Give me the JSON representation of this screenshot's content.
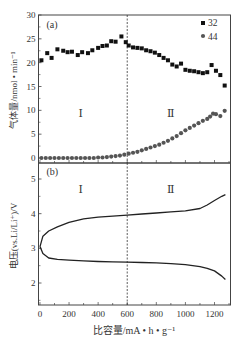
{
  "chart_data": [
    {
      "panel": "(a)",
      "type": "scatter",
      "title": "",
      "xlabel": "比容量/mA • h • g⁻¹",
      "ylabel": "气体量/nmol • min⁻¹",
      "xlim": [
        -10,
        1310
      ],
      "ylim": [
        0,
        30
      ],
      "yticks": [
        0,
        5,
        10,
        15,
        20,
        25,
        30
      ],
      "xticks": [
        0,
        200,
        400,
        600,
        800,
        1000,
        1200
      ],
      "grid": false,
      "legend_position": "top-right",
      "annotations": [
        "(a)",
        "Ⅰ",
        "Ⅱ"
      ],
      "vertical_line_x": 600,
      "series": [
        {
          "name": "32",
          "marker": "square",
          "x": [
            10,
            50,
            80,
            120,
            160,
            190,
            220,
            260,
            290,
            330,
            360,
            400,
            430,
            460,
            490,
            520,
            560,
            590,
            610,
            640,
            670,
            700,
            730,
            760,
            790,
            820,
            850,
            880,
            910,
            940,
            970,
            1000,
            1030,
            1060,
            1090,
            1120,
            1150,
            1180,
            1210,
            1240,
            1270
          ],
          "y": [
            20.5,
            22,
            21,
            22.8,
            22.5,
            22.2,
            22.3,
            21.6,
            22.2,
            22,
            22.6,
            23.1,
            23.5,
            23.6,
            24.5,
            24.4,
            25.5,
            24.3,
            23.6,
            23.2,
            23.1,
            23,
            22.6,
            22.4,
            22.1,
            21.6,
            21,
            20.5,
            19.6,
            19.2,
            19.8,
            18.5,
            18.3,
            18.2,
            18,
            17.8,
            18,
            19.5,
            18.3,
            17.4,
            15.2
          ]
        },
        {
          "name": "44",
          "marker": "circle",
          "x": [
            10,
            40,
            70,
            100,
            130,
            160,
            190,
            220,
            250,
            280,
            310,
            340,
            370,
            400,
            430,
            460,
            490,
            520,
            550,
            580,
            610,
            640,
            670,
            700,
            730,
            760,
            790,
            820,
            850,
            880,
            910,
            940,
            970,
            1000,
            1030,
            1060,
            1090,
            1120,
            1150,
            1170,
            1190,
            1210,
            1240,
            1270
          ],
          "y": [
            0,
            0,
            0,
            0,
            0,
            0,
            0,
            0,
            0,
            0,
            0,
            0,
            0,
            0.1,
            0.1,
            0.2,
            0.3,
            0.4,
            0.5,
            0.7,
            0.9,
            1.1,
            1.3,
            1.6,
            1.9,
            2.2,
            2.5,
            2.8,
            3.2,
            3.6,
            4.1,
            4.6,
            5.2,
            5.8,
            6.3,
            6.8,
            7.3,
            7.8,
            8.2,
            8.7,
            9.3,
            9.2,
            8.8,
            9.9
          ]
        }
      ]
    },
    {
      "panel": "(b)",
      "type": "line",
      "title": "",
      "xlabel": "比容量/mA • h • g⁻¹",
      "ylabel": "电压(vs.Li/Li⁺)/V",
      "xlim": [
        -10,
        1310
      ],
      "ylim": [
        1.3,
        5.1
      ],
      "yticks": [
        2,
        3,
        4,
        5
      ],
      "xticks": [
        0,
        200,
        400,
        600,
        800,
        1000,
        1200
      ],
      "grid": false,
      "annotations": [
        "(b)",
        "Ⅰ",
        "Ⅱ"
      ],
      "vertical_line_x": 600,
      "series": [
        {
          "name": "charge",
          "x": [
            0,
            20,
            60,
            120,
            200,
            300,
            400,
            500,
            600,
            700,
            800,
            900,
            1000,
            1100,
            1150,
            1200,
            1250,
            1275
          ],
          "y": [
            3.05,
            3.35,
            3.5,
            3.62,
            3.75,
            3.85,
            3.9,
            3.93,
            3.96,
            3.99,
            4.02,
            4.05,
            4.08,
            4.15,
            4.25,
            4.38,
            4.5,
            4.55
          ]
        },
        {
          "name": "discharge",
          "x": [
            0,
            20,
            60,
            120,
            200,
            300,
            400,
            500,
            600,
            700,
            800,
            900,
            1000,
            1100,
            1150,
            1200,
            1250,
            1275
          ],
          "y": [
            3.05,
            2.85,
            2.72,
            2.68,
            2.66,
            2.64,
            2.62,
            2.61,
            2.6,
            2.59,
            2.58,
            2.56,
            2.53,
            2.47,
            2.42,
            2.35,
            2.2,
            2.1
          ]
        }
      ]
    }
  ],
  "labels": {
    "panel_a": "(a)",
    "panel_b": "(b)",
    "region_1": "Ⅰ",
    "region_2": "Ⅱ",
    "legend_32": "32",
    "legend_44": "44",
    "ylabel_a": "气体量/nmol • min⁻¹",
    "ylabel_b": "电压(vs.Li/Li⁺)/V",
    "xlabel": "比容量/mA • h • g⁻¹"
  },
  "colors": {
    "series_32": "#111111",
    "series_44": "#555555",
    "axis": "#444444"
  }
}
